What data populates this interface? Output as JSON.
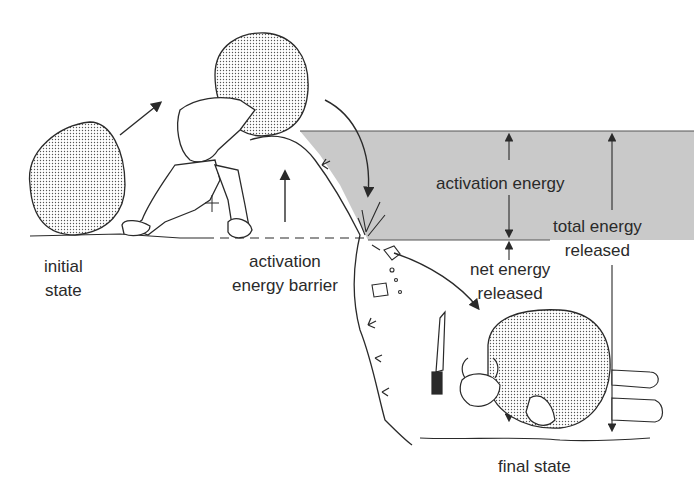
{
  "diagram": {
    "labels": {
      "initial_state_1": "initial",
      "initial_state_2": "state",
      "barrier_1": "activation",
      "barrier_2": "energy barrier",
      "activation_energy": "activation energy",
      "total_energy_1": "total energy",
      "total_energy_2": "released",
      "net_energy_1": "net energy",
      "net_energy_2": "released",
      "final_state": "final state"
    },
    "colors": {
      "band": "#c9c9c9",
      "ink": "#2a2a2a",
      "boulder": "#d8d8d8"
    }
  }
}
